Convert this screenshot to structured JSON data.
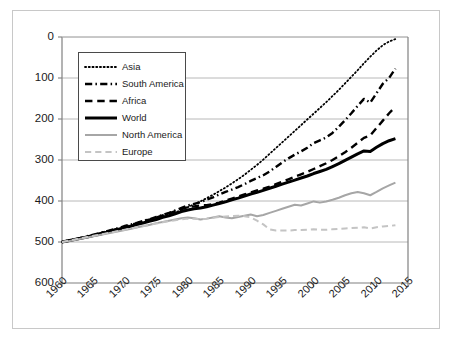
{
  "chart_data": {
    "type": "line",
    "title": "",
    "subtitle": "",
    "xlabel": "",
    "ylabel": "",
    "xlim": [
      1960,
      2015
    ],
    "ylim": [
      0,
      600
    ],
    "grid": true,
    "grid_axis": "y",
    "legend_position": "upper-left-inside",
    "x_tick_labels": [
      "1960",
      "1965",
      "1970",
      "1975",
      "1980",
      "1985",
      "1990",
      "1995",
      "2000",
      "2005",
      "2010",
      "2015"
    ],
    "x_tick_values": [
      1960,
      1965,
      1970,
      1975,
      1980,
      1985,
      1990,
      1995,
      2000,
      2005,
      2010,
      2015
    ],
    "y_tick_labels": [
      "0",
      "100",
      "200",
      "300",
      "400",
      "500",
      "600"
    ],
    "y_tick_values": [
      0,
      100,
      200,
      300,
      400,
      500,
      600
    ],
    "x": [
      1960,
      1961,
      1962,
      1963,
      1964,
      1965,
      1966,
      1967,
      1968,
      1969,
      1970,
      1971,
      1972,
      1973,
      1974,
      1975,
      1976,
      1977,
      1978,
      1979,
      1980,
      1981,
      1982,
      1983,
      1984,
      1985,
      1986,
      1987,
      1988,
      1989,
      1990,
      1991,
      1992,
      1993,
      1994,
      1995,
      1996,
      1997,
      1998,
      1999,
      2000,
      2001,
      2002,
      2003,
      2004,
      2005,
      2006,
      2007,
      2008,
      2009,
      2010,
      2011,
      2012,
      2013
    ],
    "series": [
      {
        "name": "Asia",
        "style": "dotted",
        "color": "#000000",
        "width": 1.8,
        "values": [
          100,
          103,
          106,
          110,
          113,
          117,
          120,
          124,
          128,
          132,
          136,
          140,
          144,
          148,
          152,
          157,
          162,
          167,
          172,
          178,
          185,
          192,
          199,
          207,
          215,
          224,
          233,
          243,
          253,
          264,
          276,
          288,
          301,
          315,
          329,
          343,
          357,
          371,
          385,
          399,
          413,
          427,
          441,
          456,
          471,
          487,
          503,
          519,
          536,
          552,
          567,
          580,
          589,
          595
        ]
      },
      {
        "name": "South America",
        "style": "dash-dot",
        "color": "#000000",
        "width": 2.4,
        "values": [
          100,
          103,
          107,
          110,
          114,
          118,
          122,
          126,
          130,
          134,
          139,
          143,
          147,
          152,
          156,
          161,
          166,
          171,
          177,
          183,
          189,
          193,
          197,
          203,
          209,
          216,
          222,
          228,
          234,
          241,
          249,
          256,
          263,
          272,
          283,
          294,
          304,
          313,
          321,
          330,
          341,
          348,
          355,
          366,
          381,
          397,
          414,
          432,
          449,
          440,
          463,
          486,
          500,
          523
        ]
      },
      {
        "name": "Africa",
        "style": "dashed",
        "color": "#000000",
        "width": 2.4,
        "values": [
          100,
          103,
          106,
          110,
          113,
          117,
          121,
          125,
          129,
          133,
          137,
          142,
          146,
          151,
          155,
          160,
          165,
          170,
          175,
          180,
          185,
          187,
          189,
          190,
          192,
          196,
          201,
          206,
          211,
          216,
          221,
          226,
          230,
          235,
          241,
          247,
          253,
          259,
          265,
          271,
          278,
          285,
          292,
          300,
          309,
          319,
          330,
          342,
          354,
          360,
          378,
          396,
          414,
          430
        ]
      },
      {
        "name": "World",
        "style": "solid",
        "color": "#000000",
        "width": 3.0,
        "values": [
          100,
          103,
          106,
          109,
          112,
          116,
          119,
          123,
          127,
          131,
          135,
          139,
          143,
          147,
          151,
          155,
          160,
          164,
          169,
          174,
          178,
          181,
          183,
          186,
          190,
          194,
          198,
          203,
          207,
          212,
          217,
          221,
          226,
          231,
          236,
          241,
          246,
          251,
          256,
          261,
          267,
          272,
          277,
          284,
          291,
          299,
          307,
          315,
          322,
          321,
          331,
          340,
          347,
          352
        ]
      },
      {
        "name": "North America",
        "style": "solid",
        "color": "#a6a6a6",
        "width": 2.0,
        "values": [
          100,
          102,
          105,
          108,
          111,
          114,
          117,
          120,
          123,
          126,
          129,
          132,
          136,
          139,
          142,
          146,
          149,
          152,
          155,
          158,
          160,
          158,
          155,
          157,
          160,
          163,
          160,
          158,
          161,
          164,
          167,
          163,
          166,
          171,
          176,
          181,
          186,
          191,
          189,
          194,
          199,
          196,
          199,
          203,
          208,
          214,
          219,
          222,
          219,
          214,
          222,
          231,
          238,
          245
        ]
      },
      {
        "name": "Europe",
        "style": "dashed",
        "color": "#c4c4c4",
        "width": 2.0,
        "values": [
          100,
          103,
          106,
          109,
          112,
          115,
          118,
          121,
          124,
          127,
          130,
          133,
          136,
          139,
          142,
          145,
          148,
          151,
          153,
          155,
          157,
          157,
          156,
          157,
          159,
          161,
          162,
          163,
          164,
          163,
          160,
          152,
          143,
          131,
          128,
          128,
          128,
          129,
          129,
          130,
          131,
          130,
          130,
          131,
          132,
          133,
          134,
          135,
          136,
          133,
          136,
          138,
          139,
          141
        ]
      }
    ]
  },
  "axes": {
    "y_ticks": [
      {
        "label": "600"
      },
      {
        "label": "500"
      },
      {
        "label": "400"
      },
      {
        "label": "300"
      },
      {
        "label": "200"
      },
      {
        "label": "100"
      },
      {
        "label": "0"
      }
    ],
    "x_ticks": [
      {
        "label": "1960"
      },
      {
        "label": "1965"
      },
      {
        "label": "1970"
      },
      {
        "label": "1975"
      },
      {
        "label": "1980"
      },
      {
        "label": "1985"
      },
      {
        "label": "1990"
      },
      {
        "label": "1995"
      },
      {
        "label": "2000"
      },
      {
        "label": "2005"
      },
      {
        "label": "2010"
      },
      {
        "label": "2015"
      }
    ]
  },
  "legend": {
    "entries": [
      {
        "label": "Asia"
      },
      {
        "label": "South America"
      },
      {
        "label": "Africa"
      },
      {
        "label": "World"
      },
      {
        "label": "North America"
      },
      {
        "label": "Europe"
      }
    ]
  },
  "colors": {
    "axis": "#808080",
    "grid": "#b0b0b0",
    "frame": "#c8c8c8",
    "text": "#1a1a1a",
    "black_series": "#000000",
    "north_america": "#a6a6a6",
    "europe": "#c4c4c4"
  }
}
